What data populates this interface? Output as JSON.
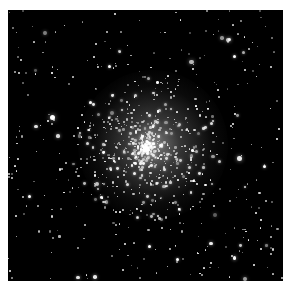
{
  "image": {
    "subject": "globular star cluster",
    "background_color": "#000000",
    "page_background": "#ffffff",
    "star_color": "#ffffff",
    "core_center": [
      145,
      148
    ]
  }
}
